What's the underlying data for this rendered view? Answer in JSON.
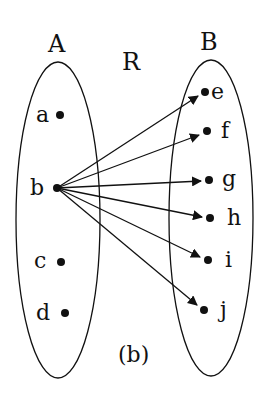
{
  "diagram": {
    "caption": "(b)",
    "relation_label": "R",
    "set_a": {
      "label": "A",
      "elements": [
        {
          "name": "a",
          "x": 60,
          "y": 115
        },
        {
          "name": "b",
          "x": 57,
          "y": 188
        },
        {
          "name": "c",
          "x": 61,
          "y": 262
        },
        {
          "name": "d",
          "x": 65,
          "y": 313
        }
      ]
    },
    "set_b": {
      "label": "B",
      "elements": [
        {
          "name": "e",
          "x": 205,
          "y": 92
        },
        {
          "name": "f",
          "x": 207,
          "y": 131
        },
        {
          "name": "g",
          "x": 209,
          "y": 180
        },
        {
          "name": "h",
          "x": 210,
          "y": 218
        },
        {
          "name": "i",
          "x": 208,
          "y": 260
        },
        {
          "name": "j",
          "x": 204,
          "y": 310
        }
      ]
    },
    "arrows": [
      {
        "from": "b",
        "to": "e"
      },
      {
        "from": "b",
        "to": "f"
      },
      {
        "from": "b",
        "to": "g"
      },
      {
        "from": "b",
        "to": "h"
      },
      {
        "from": "b",
        "to": "i"
      },
      {
        "from": "b",
        "to": "j"
      }
    ],
    "colors": {
      "stroke": "#111111",
      "background": "#ffffff"
    }
  }
}
